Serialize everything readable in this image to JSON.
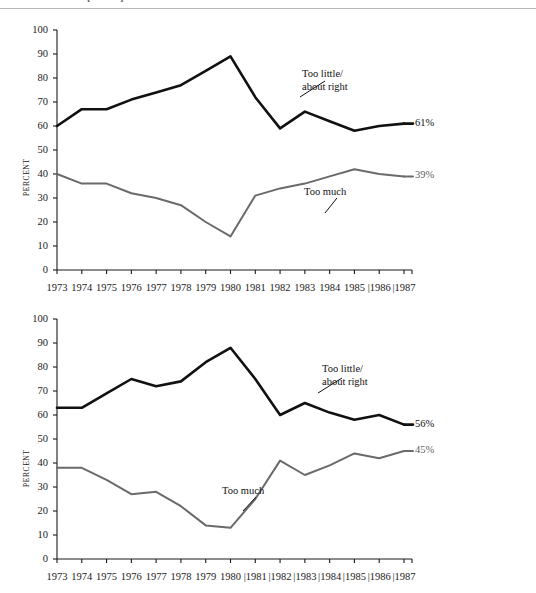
{
  "running_head": {
    "text": "Public Transit [cont'd]"
  },
  "colors": {
    "too_little_line": "#111111",
    "too_much_line": "#6a6a6a",
    "axis": "#1a1a1a",
    "rule": "#b9b9b9"
  },
  "charts": [
    {
      "id": "chart-1",
      "ylabel": "PERCENT",
      "annotations": [
        {
          "name": "too-little-annotation",
          "line1": "Too little/",
          "line2": "about right"
        },
        {
          "name": "too-much-annotation",
          "line1": "Too much",
          "line2": ""
        }
      ],
      "end_labels": {
        "too_little": "61%",
        "too_much": "39%"
      },
      "chart_data": {
        "type": "line",
        "title": "",
        "xlabel": "",
        "ylabel": "PERCENT",
        "ylim": [
          0,
          100
        ],
        "ytick_labels": [
          "0",
          "10",
          "20",
          "30",
          "40",
          "50",
          "60",
          "70",
          "80",
          "90",
          "100"
        ],
        "yticks": [
          0,
          10,
          20,
          30,
          40,
          50,
          60,
          70,
          80,
          90,
          100
        ],
        "grid": false,
        "legend": "inline-annotations",
        "x": [
          1973,
          1974,
          1975,
          1976,
          1977,
          1978,
          1979,
          1980,
          1981,
          1982,
          1983,
          1984,
          1985,
          1986,
          1987
        ],
        "xtick_labels": [
          "1973",
          "1974",
          "1975",
          "1976",
          "1977",
          "1978",
          "1979",
          "1980",
          "1981",
          "1982",
          "1983",
          "1984",
          "1985",
          "|1986",
          "|1987"
        ],
        "series": [
          {
            "name": "Too little/about right",
            "color": "#111111",
            "values": [
              60,
              67,
              67,
              71,
              74,
              77,
              83,
              89,
              72,
              59,
              66,
              62,
              58,
              60,
              61
            ]
          },
          {
            "name": "Too much",
            "color": "#6a6a6a",
            "values": [
              40,
              36,
              36,
              32,
              30,
              27,
              20,
              14,
              31,
              34,
              36,
              39,
              42,
              40,
              39
            ]
          }
        ]
      }
    },
    {
      "id": "chart-2",
      "ylabel": "PERCENT",
      "annotations": [
        {
          "name": "too-little-annotation",
          "line1": "Too little/",
          "line2": "about right"
        },
        {
          "name": "too-much-annotation",
          "line1": "Too much",
          "line2": ""
        }
      ],
      "end_labels": {
        "too_little": "56%",
        "too_much": "45%"
      },
      "chart_data": {
        "type": "line",
        "title": "",
        "xlabel": "",
        "ylabel": "PERCENT",
        "ylim": [
          0,
          100
        ],
        "ytick_labels": [
          "0",
          "10",
          "20",
          "30",
          "40",
          "50",
          "60",
          "70",
          "80",
          "90",
          "100"
        ],
        "yticks": [
          0,
          10,
          20,
          30,
          40,
          50,
          60,
          70,
          80,
          90,
          100
        ],
        "grid": false,
        "legend": "inline-annotations",
        "x": [
          1973,
          1974,
          1975,
          1976,
          1977,
          1978,
          1979,
          1980,
          1981,
          1982,
          1983,
          1984,
          1985,
          1986,
          1987
        ],
        "xtick_labels": [
          "1973",
          "1974",
          "1975",
          "1976",
          "1977",
          "1978",
          "1979",
          "1980",
          "|1981",
          "|1982",
          "|1983",
          "|1984",
          "|1985",
          "|1986",
          "|1987"
        ],
        "series": [
          {
            "name": "Too little/about right",
            "color": "#111111",
            "values": [
              63,
              63,
              69,
              75,
              72,
              74,
              82,
              88,
              75,
              60,
              65,
              61,
              58,
              60,
              56
            ]
          },
          {
            "name": "Too much",
            "color": "#6a6a6a",
            "values": [
              38,
              38,
              33,
              27,
              28,
              22,
              14,
              13,
              25,
              41,
              35,
              39,
              44,
              42,
              45
            ]
          }
        ]
      }
    }
  ]
}
